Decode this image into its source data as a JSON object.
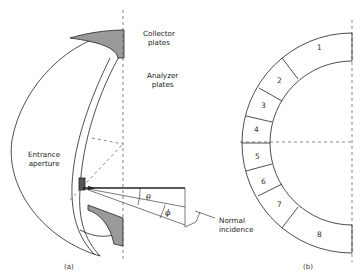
{
  "figure": {
    "panel_a": {
      "caption": "(a)",
      "labels": {
        "collector": [
          "Collector",
          "plates"
        ],
        "analyzer": [
          "Analyzer",
          "plates"
        ],
        "entrance": [
          "Entrance",
          "aperture"
        ],
        "normal": [
          "Normal",
          "incidence"
        ]
      },
      "angles": {
        "theta": "θ",
        "phi": "ϕ"
      }
    },
    "panel_b": {
      "caption": "(b)",
      "segments": [
        "1",
        "2",
        "3",
        "4",
        "5",
        "6",
        "7",
        "8"
      ]
    }
  },
  "colors": {
    "line": "#222222",
    "shade": "#999999",
    "dash": "#555555"
  }
}
